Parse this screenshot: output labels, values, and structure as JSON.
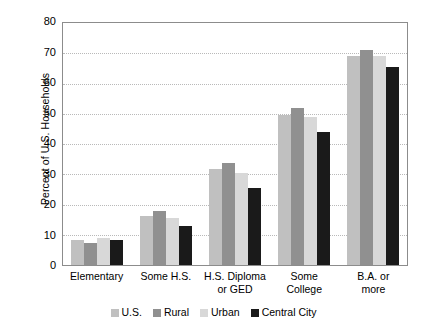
{
  "chart_data": {
    "type": "bar",
    "title": "",
    "xlabel": "",
    "ylabel": "Percent of U.S. Households",
    "ylim": [
      0,
      80
    ],
    "ytick_step": 10,
    "yticks": [
      80,
      70,
      60,
      50,
      40,
      30,
      20,
      10,
      0
    ],
    "grid": "horizontal-dotted",
    "legend_position": "bottom-center",
    "categories": [
      "Elementary",
      "Some H.S.",
      "H.S. Diploma or GED",
      "Some College",
      "B.A. or more"
    ],
    "category_lines": [
      [
        "Elementary"
      ],
      [
        "Some H.S."
      ],
      [
        "H.S. Diploma",
        "or GED"
      ],
      [
        "Some",
        "College"
      ],
      [
        "B.A. or",
        "more"
      ]
    ],
    "series": [
      {
        "name": "U.S.",
        "color": "#c0c0c0",
        "values": [
          8.2,
          16.3,
          31.8,
          49.5,
          69.0
        ]
      },
      {
        "name": "Rural",
        "color": "#909090",
        "values": [
          7.4,
          18.0,
          33.7,
          52.0,
          71.0
        ]
      },
      {
        "name": "Urban",
        "color": "#d8d8d8",
        "values": [
          9.0,
          15.5,
          30.5,
          49.0,
          69.0
        ]
      },
      {
        "name": "Central City",
        "color": "#1a1a1a",
        "values": [
          8.2,
          12.8,
          25.3,
          44.0,
          65.5
        ]
      }
    ]
  },
  "colors": {
    "axis": "#8c8c8c",
    "gridline": "#b9b9b9",
    "text": "#000000",
    "background": "#ffffff"
  }
}
